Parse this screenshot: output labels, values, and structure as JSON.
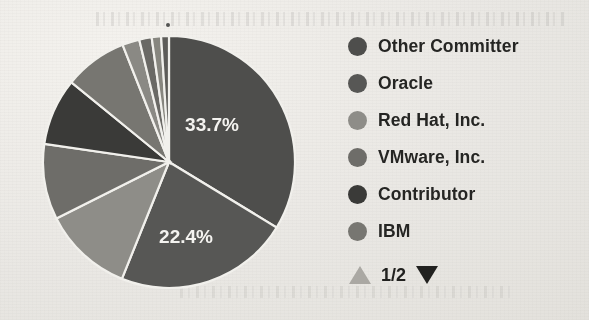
{
  "chart_data": {
    "type": "pie",
    "title": "",
    "legend_position": "right",
    "start_angle_deg": 90,
    "direction": "clockwise",
    "categories": [
      "Other Committer",
      "Oracle",
      "Red Hat, Inc.",
      "VMware, Inc.",
      "Contributor",
      "IBM",
      "Sliver 1",
      "Sliver 2",
      "Sliver 3",
      "Sliver 4"
    ],
    "values": [
      33.7,
      22.4,
      11.5,
      9.7,
      8.6,
      8.1,
      2.2,
      1.6,
      1.2,
      1.0
    ],
    "labels_shown": [
      "33.7%",
      "22.4%"
    ],
    "colors": [
      "#4f4f4d",
      "#585856",
      "#8e8d88",
      "#6e6d69",
      "#3b3b39",
      "#777671",
      "#8a8984",
      "#6a6966",
      "#87867f",
      "#5e5d5a"
    ],
    "slice_label_color": "#f2f1ee",
    "separator_color": "#efeeea"
  },
  "legend": {
    "items": [
      {
        "label": "Other Committer",
        "color": "#4f4f4d"
      },
      {
        "label": "Oracle",
        "color": "#585856"
      },
      {
        "label": "Red Hat, Inc.",
        "color": "#8e8d88"
      },
      {
        "label": "VMware, Inc.",
        "color": "#6e6d69"
      },
      {
        "label": "Contributor",
        "color": "#3b3b39"
      },
      {
        "label": "IBM",
        "color": "#777671"
      }
    ],
    "pager": {
      "up_arrow": "scroll-up-triangle",
      "down_arrow": "scroll-down-triangle",
      "page_text": "1/2",
      "up_enabled": false,
      "down_enabled": true,
      "up_color": "#a9a7a2",
      "down_color": "#232321"
    }
  },
  "slice_labels": [
    {
      "text": "33.7%",
      "x": 212,
      "y": 131
    },
    {
      "text": "22.4%",
      "x": 186,
      "y": 243
    }
  ]
}
